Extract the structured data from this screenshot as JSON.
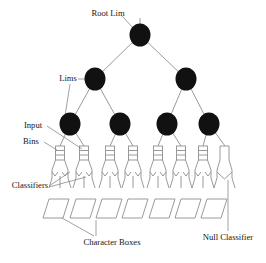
{
  "figure": {
    "type": "diagram",
    "background_color": "#ffffff",
    "node_color": "#111111",
    "line_color": "#9a9a9a",
    "text_color": "#151515"
  },
  "labels": {
    "root": "Root Lim",
    "lims": "Lims",
    "input": "Input",
    "bins": "Bins",
    "classifiers": "Classifiers",
    "character_boxes": "Character Boxes",
    "null_classifier": "Null Classifier"
  },
  "tree": {
    "levels": 3,
    "root_node": {
      "id": "root",
      "cx": 140,
      "cy": 35,
      "r": 10.5
    },
    "level2_nodes": [
      {
        "id": "lim-l",
        "cx": 95,
        "cy": 79,
        "r": 10.5
      },
      {
        "id": "lim-r",
        "cx": 186,
        "cy": 79,
        "r": 10.5
      }
    ],
    "level3_nodes": [
      {
        "id": "lim-ll",
        "cx": 70,
        "cy": 124,
        "r": 10.5
      },
      {
        "id": "lim-lr",
        "cx": 120,
        "cy": 124,
        "r": 10.5
      },
      {
        "id": "lim-rl",
        "cx": 167,
        "cy": 124,
        "r": 10.5
      },
      {
        "id": "lim-rr",
        "cx": 209,
        "cy": 124,
        "r": 10.5
      }
    ],
    "bin_units": [
      {
        "id": "bin-1",
        "x": 58,
        "rungs": 3,
        "has_classifier": true
      },
      {
        "id": "bin-2",
        "x": 82,
        "rungs": 3,
        "has_classifier": true
      },
      {
        "id": "bin-3",
        "x": 108,
        "rungs": 3,
        "has_classifier": true
      },
      {
        "id": "bin-4",
        "x": 131,
        "rungs": 3,
        "has_classifier": true
      },
      {
        "id": "bin-5",
        "x": 156,
        "rungs": 3,
        "has_classifier": true
      },
      {
        "id": "bin-6",
        "x": 179,
        "rungs": 3,
        "has_classifier": true
      },
      {
        "id": "bin-7",
        "x": 201,
        "rungs": 3,
        "has_classifier": true
      },
      {
        "id": "bin-8-null",
        "x": 223,
        "rungs": 0,
        "has_classifier": false
      }
    ],
    "character_boxes": [
      {
        "id": "box-1",
        "x": 43
      },
      {
        "id": "box-2",
        "x": 70
      },
      {
        "id": "box-3",
        "x": 96
      },
      {
        "id": "box-4",
        "x": 122
      },
      {
        "id": "box-5",
        "x": 149
      },
      {
        "id": "box-6",
        "x": 175
      },
      {
        "id": "box-7",
        "x": 201
      }
    ]
  },
  "label_positions": {
    "root": {
      "x": 108,
      "y": 14,
      "anchor": "middle"
    },
    "lims": {
      "x": 68,
      "y": 79,
      "anchor": "middle"
    },
    "input": {
      "x": 33,
      "y": 126,
      "anchor": "middle"
    },
    "bins": {
      "x": 31,
      "y": 142,
      "anchor": "middle"
    },
    "classifiers": {
      "x": 30,
      "y": 186,
      "anchor": "middle"
    },
    "character_boxes": {
      "x": 112,
      "y": 243,
      "anchor": "middle"
    },
    "null_classifier": {
      "x": 228,
      "y": 238,
      "anchor": "middle"
    }
  }
}
